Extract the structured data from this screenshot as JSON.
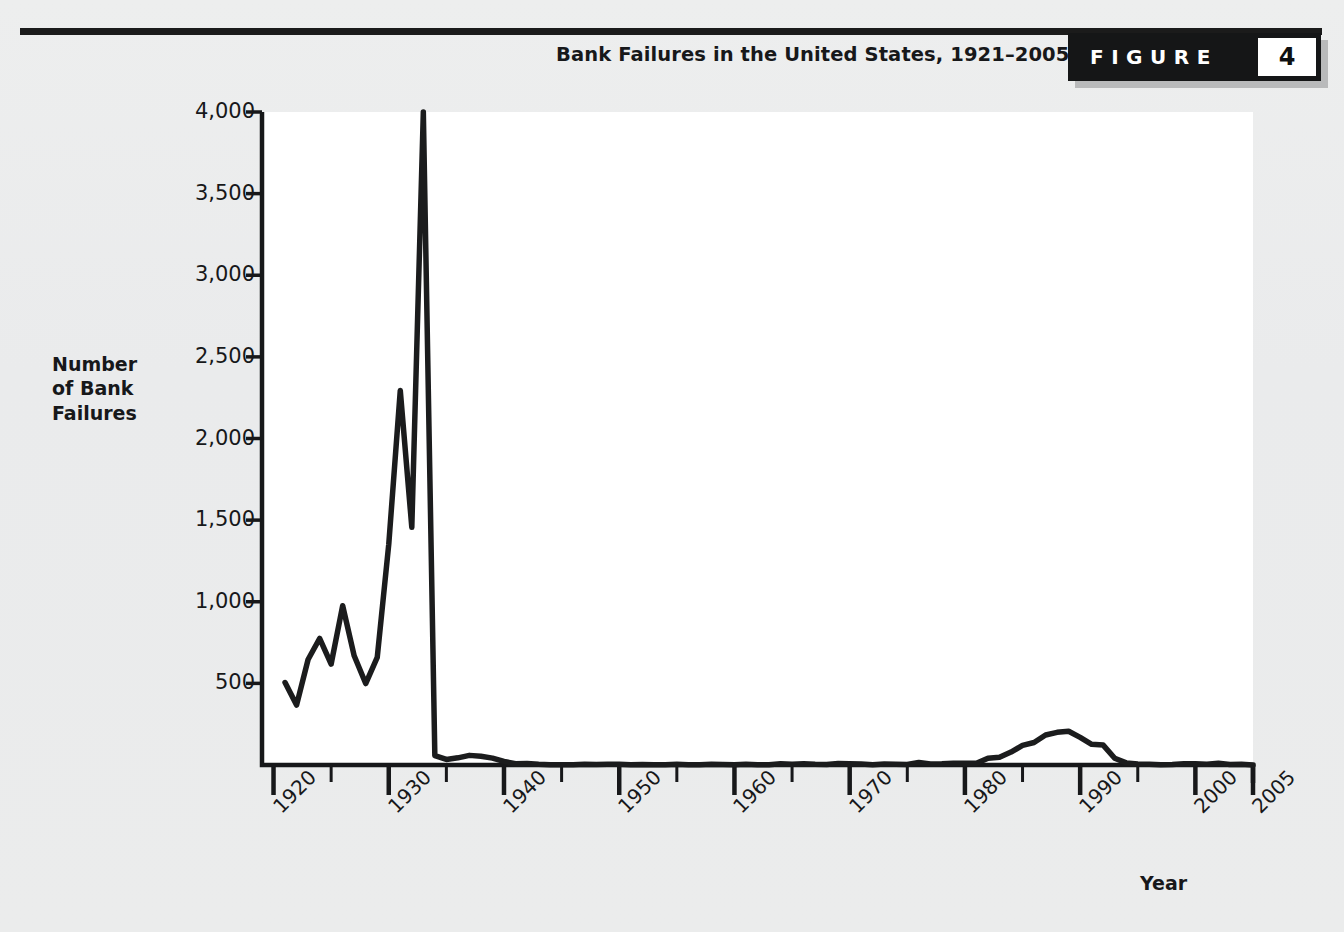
{
  "figure": {
    "title": "Bank Failures in the United States, 1921–2005",
    "badge_word": "FIGURE",
    "badge_number": "4"
  },
  "axes": {
    "y_title_lines": [
      "Number",
      "of Bank",
      "Failures"
    ],
    "x_title": "Year",
    "y_ticks": [
      "500",
      "1,000",
      "1,500",
      "2,000",
      "2,500",
      "3,000",
      "3,500",
      "4,000"
    ],
    "x_ticks": [
      "1920",
      "1930",
      "1940",
      "1950",
      "1960",
      "1970",
      "1980",
      "1990",
      "2000",
      "2005"
    ]
  },
  "colors": {
    "page_background": "#ebecec",
    "panel_background": "#ffffff",
    "ink": "#17181a",
    "line": "#1b1c1d",
    "badge_background": "#151617",
    "badge_text": "#ffffff"
  },
  "chart_data": {
    "type": "line",
    "title": "Bank Failures in the United States, 1921–2005",
    "xlabel": "Year",
    "ylabel": "Number of Bank Failures",
    "xlim": [
      1919,
      2005
    ],
    "ylim": [
      0,
      4000
    ],
    "yticks": [
      500,
      1000,
      1500,
      2000,
      2500,
      3000,
      3500,
      4000
    ],
    "xticks": [
      1920,
      1930,
      1940,
      1950,
      1960,
      1970,
      1980,
      1990,
      2000,
      2005
    ],
    "xticks_minor_step": 5,
    "grid": false,
    "legend": "none",
    "series": [
      {
        "name": "Number of Bank Failures",
        "x": [
          1921,
          1922,
          1923,
          1924,
          1925,
          1926,
          1927,
          1928,
          1929,
          1930,
          1931,
          1932,
          1933,
          1934,
          1935,
          1936,
          1937,
          1938,
          1939,
          1940,
          1941,
          1942,
          1943,
          1944,
          1945,
          1946,
          1947,
          1948,
          1949,
          1950,
          1951,
          1952,
          1953,
          1954,
          1955,
          1956,
          1957,
          1958,
          1959,
          1960,
          1961,
          1962,
          1963,
          1964,
          1965,
          1966,
          1967,
          1968,
          1969,
          1970,
          1971,
          1972,
          1973,
          1974,
          1975,
          1976,
          1977,
          1978,
          1979,
          1980,
          1981,
          1982,
          1983,
          1984,
          1985,
          1986,
          1987,
          1988,
          1989,
          1990,
          1991,
          1992,
          1993,
          1994,
          1995,
          1996,
          1997,
          1998,
          1999,
          2000,
          2001,
          2002,
          2003,
          2004,
          2005
        ],
        "values": [
          505,
          367,
          646,
          775,
          618,
          976,
          669,
          499,
          659,
          1352,
          2294,
          1456,
          4000,
          57,
          34,
          44,
          59,
          54,
          42,
          22,
          8,
          9,
          4,
          2,
          1,
          1,
          5,
          3,
          4,
          4,
          2,
          3,
          2,
          2,
          4,
          2,
          2,
          4,
          3,
          1,
          5,
          1,
          2,
          7,
          5,
          7,
          4,
          3,
          9,
          7,
          6,
          1,
          6,
          4,
          3,
          16,
          6,
          7,
          10,
          10,
          10,
          42,
          48,
          79,
          120,
          138,
          184,
          200,
          207,
          169,
          127,
          122,
          41,
          13,
          6,
          5,
          1,
          3,
          8,
          7,
          4,
          11,
          3,
          4,
          0
        ]
      }
    ],
    "annotations": [
      {
        "text": "Peak of 1933 reaches the top of the scale at 4,000",
        "x": 1933,
        "y": 4000
      }
    ]
  }
}
